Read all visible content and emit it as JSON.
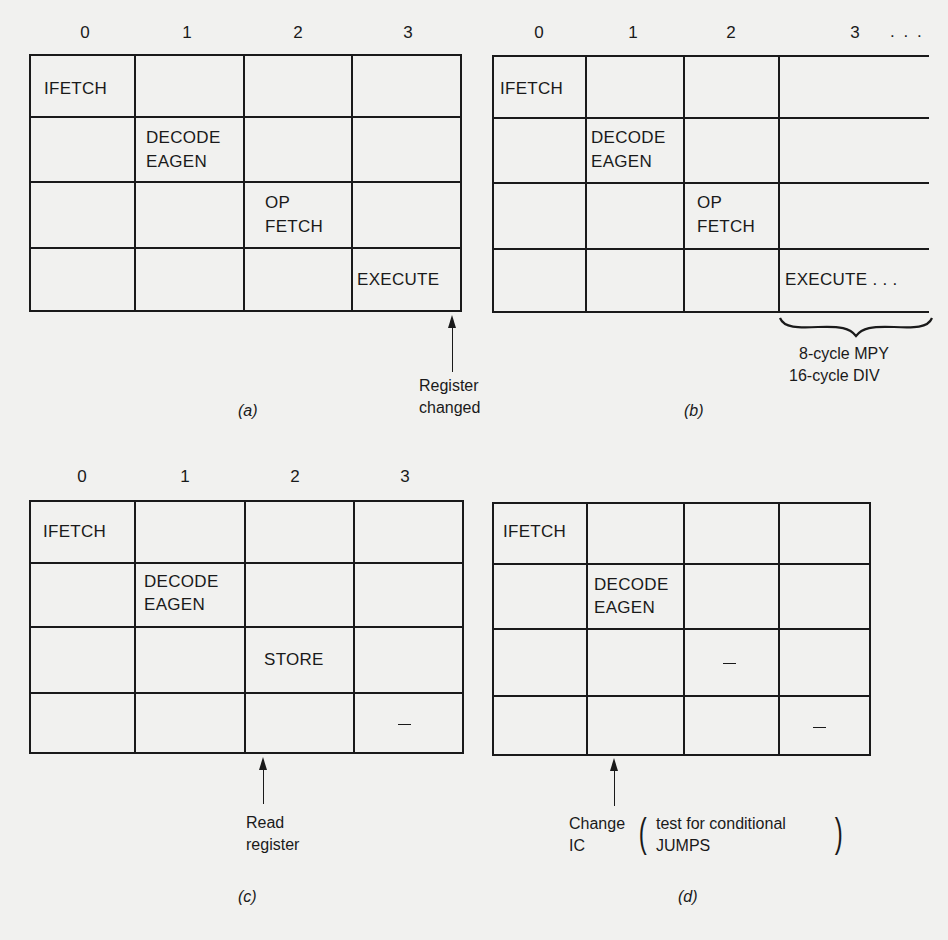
{
  "figure": {
    "panels": [
      {
        "id": "a",
        "caption": "(a)",
        "column_headers": [
          "0",
          "1",
          "2",
          "3"
        ],
        "stages": [
          {
            "row": 0,
            "col": 0,
            "lines": [
              "IFETCH"
            ]
          },
          {
            "row": 1,
            "col": 1,
            "lines": [
              "DECODE",
              "EAGEN"
            ]
          },
          {
            "row": 2,
            "col": 2,
            "lines": [
              "OP",
              "FETCH"
            ]
          },
          {
            "row": 3,
            "col": 3,
            "lines": [
              "EXECUTE"
            ]
          }
        ],
        "annotation": {
          "lines": [
            "Register",
            "changed"
          ],
          "arrow_at": "end of cycle 3"
        }
      },
      {
        "id": "b",
        "caption": "(b)",
        "column_headers": [
          "0",
          "1",
          "2",
          "3 . . ."
        ],
        "stages": [
          {
            "row": 0,
            "col": 0,
            "lines": [
              "IFETCH"
            ]
          },
          {
            "row": 1,
            "col": 1,
            "lines": [
              "DECODE",
              "EAGEN"
            ]
          },
          {
            "row": 2,
            "col": 2,
            "lines": [
              "OP",
              "FETCH"
            ]
          },
          {
            "row": 3,
            "col": 3,
            "lines": [
              "EXECUTE . . ."
            ]
          }
        ],
        "annotation": {
          "lines": [
            "8-cycle MPY",
            "16-cycle DIV"
          ],
          "marker": "brace under cycle 3+"
        }
      },
      {
        "id": "c",
        "caption": "(c)",
        "column_headers": [
          "0",
          "1",
          "2",
          "3"
        ],
        "stages": [
          {
            "row": 0,
            "col": 0,
            "lines": [
              "IFETCH"
            ]
          },
          {
            "row": 1,
            "col": 1,
            "lines": [
              "DECODE",
              "EAGEN"
            ]
          },
          {
            "row": 2,
            "col": 2,
            "lines": [
              "STORE"
            ]
          },
          {
            "row": 3,
            "col": 3,
            "lines": [
              "—"
            ]
          }
        ],
        "annotation": {
          "lines": [
            "Read",
            "register"
          ],
          "arrow_at": "start of cycle 2"
        }
      },
      {
        "id": "d",
        "caption": "(d)",
        "column_headers": [],
        "stages": [
          {
            "row": 0,
            "col": 0,
            "lines": [
              "IFETCH"
            ]
          },
          {
            "row": 1,
            "col": 1,
            "lines": [
              "DECODE",
              "EAGEN"
            ]
          },
          {
            "row": 2,
            "col": 2,
            "lines": [
              "—"
            ]
          },
          {
            "row": 3,
            "col": 3,
            "lines": [
              "—"
            ]
          }
        ],
        "annotation": {
          "lines": [
            "Change",
            "IC"
          ],
          "paren_lines": [
            "test for conditional",
            "JUMPS"
          ],
          "arrow_at": "start of cycle 1"
        }
      }
    ]
  },
  "text": {
    "a_h0": "0",
    "a_h1": "1",
    "a_h2": "2",
    "a_h3": "3",
    "b_h0": "0",
    "b_h1": "1",
    "b_h2": "2",
    "b_h3": "3",
    "b_h3_more": ". . .",
    "c_h0": "0",
    "c_h1": "1",
    "c_h2": "2",
    "c_h3": "3",
    "ifetch": "IFETCH",
    "decode": "DECODE",
    "eagen": "EAGEN",
    "op": "OP",
    "fetch": "FETCH",
    "execute": "EXECUTE",
    "execute_more": "EXECUTE . . .",
    "store": "STORE",
    "a_note1": "Register",
    "a_note2": "changed",
    "b_note1": "8-cycle MPY",
    "b_note2": "16-cycle DIV",
    "c_note1": "Read",
    "c_note2": "register",
    "d_note1": "Change",
    "d_note2": "IC",
    "d_paren1": "test for conditional",
    "d_paren2": "JUMPS",
    "cap_a": "(a)",
    "cap_b": "(b)",
    "cap_c": "(c)",
    "cap_d": "(d)"
  }
}
